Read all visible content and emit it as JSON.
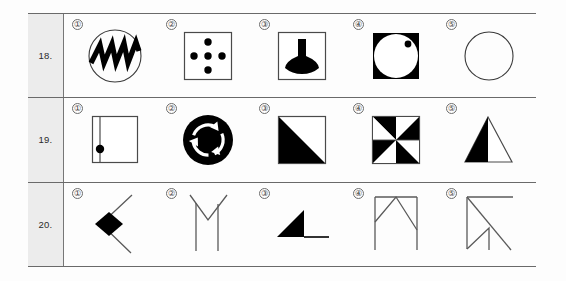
{
  "page": {
    "background_color": "#fdfdfd",
    "table_border_color": "#6a6a6a",
    "number_cell_background": "#ececec",
    "ink_color": "#000000",
    "line_color": "#4a4a4a"
  },
  "rows": [
    {
      "number": "18.",
      "options": [
        {
          "label": "①",
          "name": "figure-circle-with-zigzag",
          "description": "Outlined circle containing a thick black zigzag / sawtooth band"
        },
        {
          "label": "②",
          "name": "figure-square-five-dots",
          "description": "Outlined square containing five black dots arranged as a plus sign"
        },
        {
          "label": "③",
          "name": "figure-square-black-flask",
          "description": "Outlined square containing a solid black flask / funnel shape"
        },
        {
          "label": "④",
          "name": "figure-black-square-white-circle-dot",
          "description": "Solid black square with a large white circle inside and a small black dot near the upper right of the circle"
        },
        {
          "label": "⑤",
          "name": "figure-plain-circle",
          "description": "Plain outlined circle"
        }
      ]
    },
    {
      "number": "19.",
      "options": [
        {
          "label": "①",
          "name": "figure-square-vertical-line-dot",
          "description": "Outlined square with a vertical line near the left edge and a black dot on that line"
        },
        {
          "label": "②",
          "name": "figure-black-circle-recycle-arrows",
          "description": "Solid black disc with three white circular chasing arrows"
        },
        {
          "label": "③",
          "name": "figure-square-black-left-triangle",
          "description": "Outlined square whose lower-left triangular half is solid black"
        },
        {
          "label": "④",
          "name": "figure-pinwheel-square",
          "description": "Outlined square divided into eight wedges coloured alternately black and white, forming a pinwheel"
        },
        {
          "label": "⑤",
          "name": "figure-triangle-half-black",
          "description": "Outlined triangle whose left portion is solid black"
        }
      ]
    },
    {
      "number": "20.",
      "options": [
        {
          "label": "①",
          "name": "figure-chevron-with-diamond",
          "description": "Open chevron pointing left with a solid black diamond at the vertex"
        },
        {
          "label": "②",
          "name": "figure-v-with-two-stems",
          "description": "Thin V shape with two long vertical stems descending from it"
        },
        {
          "label": "③",
          "name": "figure-black-right-triangle-with-tail",
          "description": "Solid black right triangle with a horizontal line extending to the right along the base"
        },
        {
          "label": "④",
          "name": "figure-bridge-lines",
          "description": "Rectangle outline of lines with a peak in the middle forming a bridge / tent of line segments"
        },
        {
          "label": "⑤",
          "name": "figure-flag-diagonal-lines",
          "description": "Set of straight line segments: horizontal top bar, left vertical stem, long diagonal and a small inner peak"
        }
      ]
    }
  ]
}
